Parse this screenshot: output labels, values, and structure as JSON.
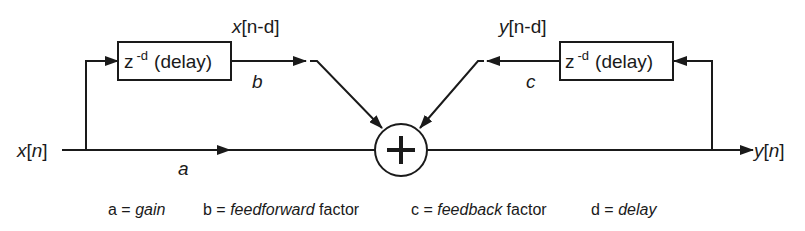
{
  "diagram": {
    "type": "comb-filter-block-diagram",
    "input": {
      "var": "x",
      "open": "[",
      "idx": "n",
      "close": "]"
    },
    "output": {
      "var": "y",
      "open": "[",
      "idx": "n",
      "close": "]"
    },
    "feedforward_delay": {
      "box_z": "z",
      "box_exp": "-d",
      "box_text": "(delay)",
      "signal_var": "x",
      "signal_idx": "[n-d]",
      "gain_label": "b"
    },
    "feedback_delay": {
      "box_z": "z",
      "box_exp": "-d",
      "box_text": "(delay)",
      "signal_var": "y",
      "signal_idx": "[n-d]",
      "gain_label": "c"
    },
    "direct_gain_label": "a",
    "summer_symbol": "+"
  },
  "legend": [
    {
      "sym": "a = ",
      "term": "gain",
      "suffix": ""
    },
    {
      "sym": "b = ",
      "term": "feedforward",
      "suffix": " factor"
    },
    {
      "sym": "c = ",
      "term": "feedback",
      "suffix": " factor"
    },
    {
      "sym": "d = ",
      "term": "delay",
      "suffix": ""
    }
  ],
  "colors": {
    "ink": "#1a1a1a",
    "background": "#ffffff"
  }
}
